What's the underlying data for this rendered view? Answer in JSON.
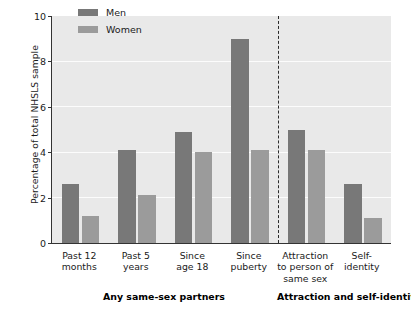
{
  "chart_data": {
    "type": "bar",
    "title": "",
    "xlabel": "",
    "ylabel": "Percentage of total NHSLS sample",
    "ylim": [
      0,
      10
    ],
    "yticks": [
      "0",
      "2",
      "4",
      "6",
      "8",
      "10"
    ],
    "grid": "horizontal-white-at-2-4-6-8",
    "legend_position": "top-left-inside",
    "categories": [
      "Past 12\nmonths",
      "Past 5\nyears",
      "Since\nage 18",
      "Since\npuberty",
      "Attraction\nto person of\nsame sex",
      "Self-\nidentity"
    ],
    "category_lines": [
      [
        "Past 12",
        "months"
      ],
      [
        "Past 5",
        "years"
      ],
      [
        "Since",
        "age 18"
      ],
      [
        "Since",
        "puberty"
      ],
      [
        "Attraction",
        "to person of",
        "same sex"
      ],
      [
        "Self-",
        "identity"
      ]
    ],
    "series": [
      {
        "name": "Men",
        "color": "#787878",
        "values": [
          2.6,
          4.1,
          4.9,
          9.0,
          5.0,
          2.6
        ]
      },
      {
        "name": "Women",
        "color": "#9b9b9b",
        "values": [
          1.2,
          2.1,
          4.0,
          4.1,
          4.1,
          1.1
        ]
      }
    ],
    "group_labels": [
      "Any same-sex partners",
      "Attraction and self-identity"
    ],
    "annotations": [
      {
        "type": "vertical-dashed-divider",
        "after_category_index": 3
      }
    ],
    "colors": {
      "plot_background": "#e9e9e9",
      "gridline": "#fcfcfc",
      "axis": "#333333",
      "men_bar": "#787878",
      "women_bar": "#9b9b9b",
      "text": "#1a1a1a"
    }
  }
}
